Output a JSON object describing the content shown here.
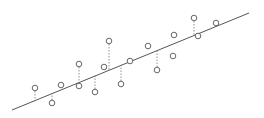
{
  "diagram": {
    "title": "",
    "colors": {
      "line": "#555555",
      "points": "#555555",
      "residuals": "#777777",
      "background": "#ffffff"
    },
    "regression_line": {
      "x1": 12,
      "y1": 110,
      "x2": 249,
      "y2": 13
    },
    "points": [
      {
        "x": 35,
        "y": 88,
        "residual": true
      },
      {
        "x": 52,
        "y": 103,
        "residual": true
      },
      {
        "x": 61,
        "y": 85,
        "residual": false
      },
      {
        "x": 79,
        "y": 64,
        "residual": true
      },
      {
        "x": 79,
        "y": 86,
        "residual": false
      },
      {
        "x": 95,
        "y": 92,
        "residual": true
      },
      {
        "x": 104,
        "y": 67,
        "residual": false
      },
      {
        "x": 109,
        "y": 41,
        "residual": true
      },
      {
        "x": 121,
        "y": 84,
        "residual": true
      },
      {
        "x": 130,
        "y": 61,
        "residual": false
      },
      {
        "x": 148,
        "y": 46,
        "residual": false
      },
      {
        "x": 157,
        "y": 70,
        "residual": true
      },
      {
        "x": 173,
        "y": 56,
        "residual": false
      },
      {
        "x": 174,
        "y": 35,
        "residual": false
      },
      {
        "x": 194,
        "y": 18,
        "residual": true
      },
      {
        "x": 198,
        "y": 36,
        "residual": false
      },
      {
        "x": 216,
        "y": 23,
        "residual": false
      }
    ]
  }
}
